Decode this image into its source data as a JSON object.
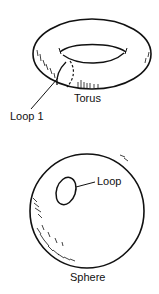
{
  "figure": {
    "torus": {
      "label": "Torus",
      "loop_label": "Loop 1"
    },
    "sphere": {
      "label": "Sphere",
      "loop_label": "Loop"
    }
  },
  "colors": {
    "ink": "#111111",
    "background": "#ffffff"
  }
}
